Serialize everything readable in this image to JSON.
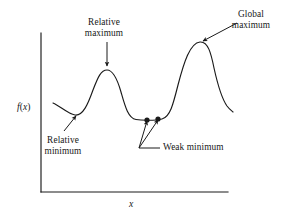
{
  "figure": {
    "kind": "function-extrema-diagram",
    "axes": {
      "ylabel": "f(x)",
      "ylabel_parts": {
        "f": "f",
        "open": "(",
        "var": "x",
        "close": ")"
      },
      "xlabel": "x",
      "y_axis_top_y": 33,
      "y_axis_x": 41,
      "x_axis_y": 192,
      "x_axis_right_x": 228
    },
    "annotations": [
      {
        "name": "relative-maximum",
        "line1": "Relative",
        "line2": "maximum",
        "text_center_x": 104,
        "line1_y": 17,
        "line2_y": 28,
        "arrow_from": [
          107,
          42
        ],
        "arrow_to": [
          107,
          66
        ]
      },
      {
        "name": "global-maximum",
        "line1": "Global",
        "line2": "maximum",
        "text_center_x": 251,
        "line1_y": 9,
        "line2_y": 20,
        "arrow_from": [
          237,
          23
        ],
        "arrow_to": [
          203,
          41
        ]
      },
      {
        "name": "relative-minimum",
        "line1": "Relative",
        "line2": "minimum",
        "text_center_x": 63,
        "line1_y": 135,
        "line2_y": 146,
        "arrow_from": [
          64,
          131
        ],
        "arrow_to": [
          76,
          116
        ]
      },
      {
        "name": "weak-minimum",
        "line1": "Weak minimum",
        "text_left_x": 163,
        "line1_y": 142,
        "elbow": [
          139,
          148
        ],
        "elbow_to": [
          160,
          148
        ],
        "arrow1_to": [
          147,
          121
        ],
        "arrow2_to": [
          158,
          120
        ]
      }
    ],
    "markers": [
      {
        "name": "weak-minimum-point-left",
        "cx": 147,
        "cy": 120,
        "r": 2.6
      },
      {
        "name": "weak-minimum-point-right",
        "cx": 158,
        "cy": 119,
        "r": 2.6
      }
    ],
    "curve": {
      "name": "function-curve",
      "path": "M 53,103 C 60,106 68,114 75,115 C 83,116 88,104 93,90 C 98,77 101,70 107,70 C 113,70 117,78 121,92 C 125,106 128,118 136,119.5 C 142,120.6 155,120.6 162,119 C 170,117 173,105 178,85 C 184,62 190,43 200,42 C 208,41.3 211,53 214,68 C 218,86 222,99 227,106 C 230,110 232,111 233,112"
    },
    "style": {
      "stroke": "#1a1a1a",
      "axis_stroke": "#1a1a1a",
      "curve_width": 1.15,
      "axis_width": 1.15,
      "background": "#ffffff"
    }
  }
}
